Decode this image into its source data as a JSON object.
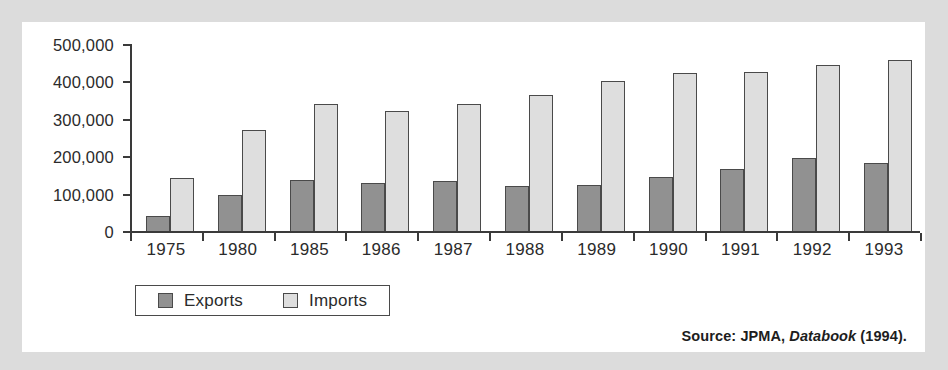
{
  "chart_data": {
    "type": "bar",
    "title": "",
    "subtitle": "",
    "xlabel": "",
    "ylabel": "",
    "categories": [
      "1975",
      "1980",
      "1985",
      "1986",
      "1987",
      "1988",
      "1989",
      "1990",
      "1991",
      "1992",
      "1993"
    ],
    "series": [
      {
        "name": "Exports",
        "color": "#919191",
        "values": [
          40000,
          97000,
          137000,
          128000,
          135000,
          120000,
          123000,
          145000,
          167000,
          195000,
          183000
        ]
      },
      {
        "name": "Imports",
        "color": "#dedede",
        "values": [
          143000,
          270000,
          340000,
          320000,
          340000,
          365000,
          400000,
          423000,
          425000,
          445000,
          458000
        ]
      }
    ],
    "ylim": [
      0,
      500000
    ],
    "y_ticks": [
      0,
      100000,
      200000,
      300000,
      400000,
      500000
    ],
    "y_tick_labels": [
      "0",
      "100,000",
      "200,000",
      "300,000",
      "400,000",
      "500,000"
    ],
    "grid": false,
    "legend_position": "bottom-left",
    "legend_entries": [
      "Exports",
      "Imports"
    ]
  },
  "source": {
    "prefix": "Source: JPMA, ",
    "italic": "Databook",
    "suffix": " (1994)."
  },
  "colors": {
    "page_background": "#dcdcdc",
    "panel_background": "#ffffff",
    "axis": "#3a3a3a",
    "exports": "#919191",
    "imports": "#dedede",
    "bar_outline": "#4a4a4a",
    "text": "#2b2b2b"
  }
}
